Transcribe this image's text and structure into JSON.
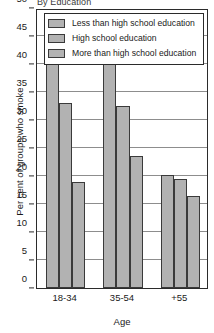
{
  "chart_data": {
    "type": "bar",
    "title": "By Education",
    "xlabel": "Age",
    "ylabel": "Per cent of groups who smoke",
    "categories": [
      "18-34",
      "35-54",
      "+55"
    ],
    "series": [
      {
        "name": "Less than high school education",
        "values": [
          40.5,
          41.7,
          20.2
        ]
      },
      {
        "name": "High school education",
        "values": [
          33.0,
          32.5,
          19.5
        ]
      },
      {
        "name": "More than high school education",
        "values": [
          19.0,
          23.5,
          16.5
        ]
      }
    ],
    "ylim": [
      0,
      50
    ],
    "yticks": [
      0,
      5,
      10,
      15,
      20,
      25,
      30,
      35,
      40,
      45,
      50
    ],
    "ytick_labels": [
      "0",
      "5",
      "10",
      "15",
      "20",
      "25",
      "30",
      "35",
      "40",
      "45",
      "50"
    ],
    "grid": true,
    "legend_position": "top-center",
    "bar_color": "#b2b2b2",
    "bar_edge_color": "#3a3a3a",
    "grid_color": "#8d8d8d",
    "axis_color": "#2b2b2b"
  },
  "legend": {
    "items": [
      {
        "label": "Less than high school education"
      },
      {
        "label": "High school education"
      },
      {
        "label": "More than high school education"
      }
    ]
  }
}
